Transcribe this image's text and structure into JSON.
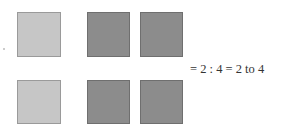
{
  "diagram": {
    "rows": [
      {
        "light_count": 1,
        "dark_count": 2
      },
      {
        "light_count": 1,
        "dark_count": 2
      }
    ],
    "colors": {
      "light": "#c6c6c6",
      "dark": "#8c8c8c"
    },
    "equation": "= 2 : 4  = 2 to 4"
  }
}
